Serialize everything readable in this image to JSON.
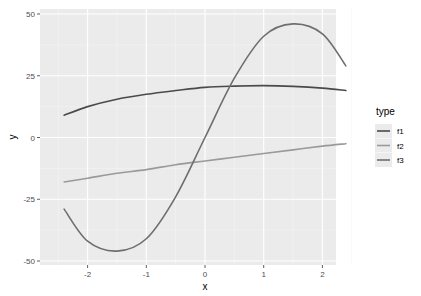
{
  "chart_data": {
    "type": "line",
    "title": "",
    "xlabel": "x",
    "ylabel": "y",
    "xlim": [
      -2.5,
      2.5
    ],
    "ylim": [
      -50,
      50
    ],
    "x_ticks": [
      -2,
      -1,
      0,
      1,
      2
    ],
    "x_tick_labels": [
      "-2",
      "-1",
      "0",
      "1",
      "2"
    ],
    "y_ticks": [
      50,
      25,
      0,
      -25,
      -50
    ],
    "y_tick_labels": [
      "50",
      "25",
      "0",
      "-25",
      "-50"
    ],
    "grid": true,
    "legend": {
      "title": "type",
      "position": "right",
      "entries": [
        "f1",
        "f2",
        "f3"
      ]
    },
    "x": [
      -2.4,
      -2.0,
      -1.5,
      -1.0,
      -0.5,
      0.0,
      0.5,
      1.0,
      1.5,
      2.0,
      2.4
    ],
    "series": [
      {
        "name": "f1",
        "color": "#4a4a4a",
        "values": [
          9,
          12.5,
          15.5,
          17.5,
          19,
          20.3,
          20.8,
          21,
          20.7,
          20,
          19
        ]
      },
      {
        "name": "f2",
        "color": "#9a9a9a",
        "values": [
          -18,
          -16.5,
          -14.5,
          -13,
          -11,
          -9.5,
          -8,
          -6.5,
          -5,
          -3.5,
          -2.5
        ]
      },
      {
        "name": "f3",
        "color": "#6e6e6e",
        "values": [
          -29,
          -42,
          -46,
          -41,
          -24,
          0,
          24,
          41,
          46,
          42,
          29
        ]
      }
    ]
  }
}
